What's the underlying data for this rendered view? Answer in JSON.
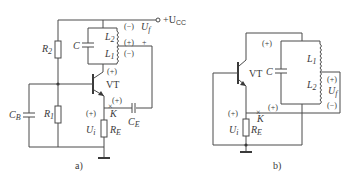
{
  "diagrams": [
    {
      "caption": "a)",
      "labels": {
        "vcc": "+U",
        "vcc_sub": "CC",
        "r2": "R",
        "r2_sub": "2",
        "c": "C",
        "l2": "L",
        "l2_sub": "2",
        "l1": "L",
        "l1_sub": "1",
        "uf": "U",
        "uf_sub": "f",
        "uf_plus": "+",
        "pol_l2_top": "(−)",
        "pol_tap": "(+)",
        "pol_l1_bot": "(−)",
        "pol_collector": "(+)",
        "vt": "VT",
        "cb": "C",
        "cb_sub": "B",
        "r1": "R",
        "r1_sub": "1",
        "pol_emitter": "(+)",
        "pol_ui": "(+)",
        "k": "K",
        "ui": "U",
        "ui_sub": "i",
        "re": "R",
        "re_sub": "E",
        "ce": "C",
        "ce_sub": "E"
      }
    },
    {
      "caption": "b)",
      "labels": {
        "pol_collector": "(+)",
        "vt": "VT",
        "c": "C",
        "l1": "L",
        "l1_sub": "1",
        "l2": "L",
        "l2_sub": "2",
        "pol_tap": "(+)",
        "uf": "U",
        "uf_sub": "f",
        "pol_bottom": "(−)",
        "pol_emitter": "(+)",
        "pol_ui": "(+)",
        "k": "K",
        "ui": "U",
        "ui_sub": "i",
        "re": "R",
        "re_sub": "E"
      }
    }
  ]
}
